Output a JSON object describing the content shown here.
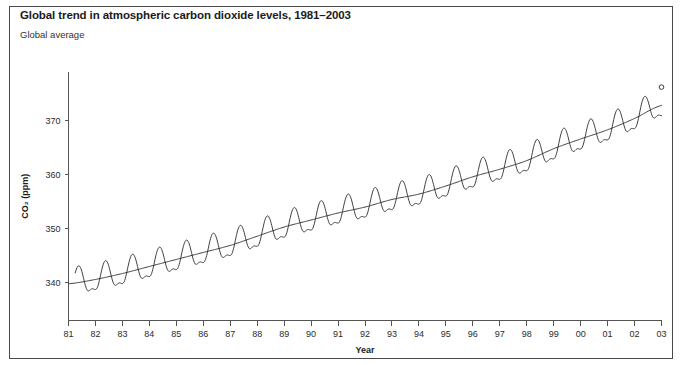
{
  "figure": {
    "title": "Global trend in atmospheric carbon dioxide levels, 1981–2003",
    "subtitle": "Global average",
    "frame_color": "#4a4a4a",
    "background": "#ffffff"
  },
  "chart_data": {
    "type": "line",
    "title": "Global trend in atmospheric carbon dioxide levels, 1981–2003",
    "subtitle": "Global average",
    "xlabel": "Year",
    "ylabel": "CO2 (ppm)",
    "ylabel_display": "CO₂ (ppm)",
    "xlim": [
      1981,
      2003
    ],
    "ylim": [
      333,
      379
    ],
    "grid": false,
    "legend": "none",
    "line_color": "#2a2a2a",
    "x_ticks": [
      1981,
      1982,
      1983,
      1984,
      1985,
      1986,
      1987,
      1988,
      1989,
      1990,
      1991,
      1992,
      1993,
      1994,
      1995,
      1996,
      1997,
      1998,
      1999,
      2000,
      2001,
      2002,
      2003
    ],
    "x_tick_labels": [
      "81",
      "82",
      "83",
      "84",
      "85",
      "86",
      "87",
      "88",
      "89",
      "90",
      "91",
      "92",
      "93",
      "94",
      "95",
      "96",
      "97",
      "98",
      "99",
      "00",
      "01",
      "02",
      "03"
    ],
    "y_ticks": [
      340,
      350,
      360,
      370
    ],
    "y_tick_labels": [
      "340",
      "350",
      "360",
      "370"
    ],
    "seasonal_amplitude_ppm": 3.1,
    "series": [
      {
        "name": "Monthly mean CO2 (with seasonal cycle)",
        "style": "oscillating",
        "x": [
          1981,
          2003
        ],
        "note": "Seasonal sawtooth oscillation of about ±3 ppm superimposed on the trend"
      },
      {
        "name": "Smoothed trend",
        "style": "smooth",
        "x": [
          1981.0,
          1982.0,
          1983.0,
          1984.0,
          1985.0,
          1986.0,
          1987.0,
          1988.0,
          1989.0,
          1990.0,
          1991.0,
          1992.0,
          1993.0,
          1994.0,
          1995.0,
          1996.0,
          1997.0,
          1998.0,
          1999.0,
          2000.0,
          2001.0,
          2002.0,
          2003.0
        ],
        "values": [
          339.8,
          340.6,
          341.7,
          343.0,
          344.3,
          345.6,
          346.9,
          348.6,
          350.3,
          351.6,
          352.9,
          354.0,
          355.4,
          356.4,
          357.9,
          359.6,
          361.0,
          362.6,
          364.8,
          366.6,
          368.3,
          370.4,
          372.8
        ]
      }
    ],
    "endpoint_marker": {
      "x": 2003,
      "y": 376.2,
      "shape": "circle"
    }
  },
  "axes": {
    "x_axis_title": "Year",
    "y_axis_title": "CO₂ (ppm)"
  }
}
